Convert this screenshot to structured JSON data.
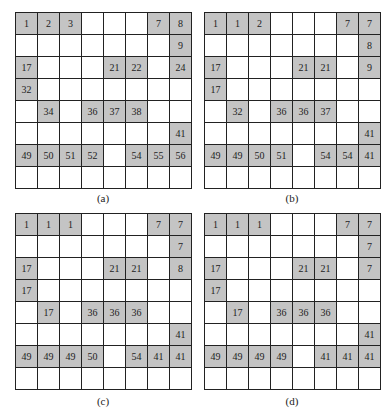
{
  "colors": {
    "filled": "#c4c4c4",
    "empty": "#ffffff",
    "border": "#222222"
  },
  "panels": [
    {
      "caption": "(a)",
      "cells": [
        [
          "1",
          "2",
          "3",
          "",
          "",
          "",
          "7",
          "8"
        ],
        [
          "",
          "",
          "",
          "",
          "",
          "",
          "",
          "9"
        ],
        [
          "17",
          "",
          "",
          "",
          "21",
          "22",
          "",
          "24"
        ],
        [
          "32",
          "",
          "",
          "",
          "",
          "",
          "",
          ""
        ],
        [
          "",
          "34",
          "",
          "36",
          "37",
          "38",
          "",
          ""
        ],
        [
          "",
          "",
          "",
          "",
          "",
          "",
          "",
          "41"
        ],
        [
          "49",
          "50",
          "51",
          "52",
          "",
          "54",
          "55",
          "56"
        ],
        [
          "",
          "",
          "",
          "",
          "",
          "",
          "",
          ""
        ]
      ]
    },
    {
      "caption": "(b)",
      "cells": [
        [
          "1",
          "1",
          "2",
          "",
          "",
          "",
          "7",
          "7"
        ],
        [
          "",
          "",
          "",
          "",
          "",
          "",
          "",
          "8"
        ],
        [
          "17",
          "",
          "",
          "",
          "21",
          "21",
          "",
          "9"
        ],
        [
          "17",
          "",
          "",
          "",
          "",
          "",
          "",
          ""
        ],
        [
          "",
          "32",
          "",
          "36",
          "36",
          "37",
          "",
          ""
        ],
        [
          "",
          "",
          "",
          "",
          "",
          "",
          "",
          "41"
        ],
        [
          "49",
          "49",
          "50",
          "51",
          "",
          "54",
          "54",
          "41"
        ],
        [
          "",
          "",
          "",
          "",
          "",
          "",
          "",
          ""
        ]
      ]
    },
    {
      "caption": "(c)",
      "cells": [
        [
          "1",
          "1",
          "1",
          "",
          "",
          "",
          "7",
          "7"
        ],
        [
          "",
          "",
          "",
          "",
          "",
          "",
          "",
          "7"
        ],
        [
          "17",
          "",
          "",
          "",
          "21",
          "21",
          "",
          "8"
        ],
        [
          "17",
          "",
          "",
          "",
          "",
          "",
          "",
          ""
        ],
        [
          "",
          "17",
          "",
          "36",
          "36",
          "36",
          "",
          ""
        ],
        [
          "",
          "",
          "",
          "",
          "",
          "",
          "",
          "41"
        ],
        [
          "49",
          "49",
          "49",
          "50",
          "",
          "54",
          "41",
          "41"
        ],
        [
          "",
          "",
          "",
          "",
          "",
          "",
          "",
          ""
        ]
      ]
    },
    {
      "caption": "(d)",
      "cells": [
        [
          "1",
          "1",
          "1",
          "",
          "",
          "",
          "7",
          "7"
        ],
        [
          "",
          "",
          "",
          "",
          "",
          "",
          "",
          "7"
        ],
        [
          "17",
          "",
          "",
          "",
          "21",
          "21",
          "",
          "7"
        ],
        [
          "17",
          "",
          "",
          "",
          "",
          "",
          "",
          ""
        ],
        [
          "",
          "17",
          "",
          "36",
          "36",
          "36",
          "",
          ""
        ],
        [
          "",
          "",
          "",
          "",
          "",
          "",
          "",
          "41"
        ],
        [
          "49",
          "49",
          "49",
          "49",
          "",
          "41",
          "41",
          "41"
        ],
        [
          "",
          "",
          "",
          "",
          "",
          "",
          "",
          ""
        ]
      ]
    }
  ]
}
